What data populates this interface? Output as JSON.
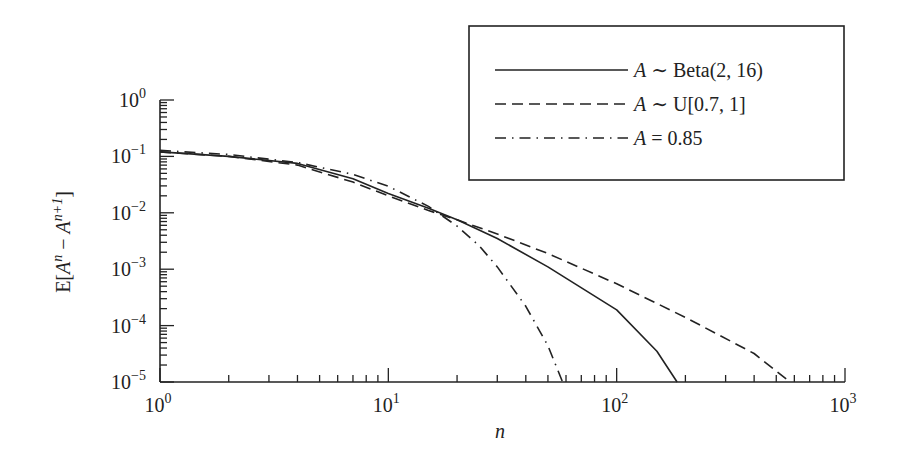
{
  "chart_data": {
    "type": "line",
    "title": "",
    "xlabel": "n",
    "ylabel": "E[A^n − A^(n+1)]",
    "xscale": "log",
    "yscale": "log",
    "xlim": [
      1,
      1000
    ],
    "ylim": [
      1e-05,
      1
    ],
    "grid": false,
    "legend_position": "upper right",
    "x_ticks": [
      {
        "value": 1,
        "base": "10",
        "exp": "0"
      },
      {
        "value": 10,
        "base": "10",
        "exp": "1"
      },
      {
        "value": 100,
        "base": "10",
        "exp": "2"
      },
      {
        "value": 1000,
        "base": "10",
        "exp": "3"
      }
    ],
    "y_ticks": [
      {
        "value": 1,
        "base": "10",
        "exp": "0"
      },
      {
        "value": 0.1,
        "base": "10",
        "exp": "−1"
      },
      {
        "value": 0.01,
        "base": "10",
        "exp": "−2"
      },
      {
        "value": 0.001,
        "base": "10",
        "exp": "−3"
      },
      {
        "value": 0.0001,
        "base": "10",
        "exp": "−4"
      },
      {
        "value": 1e-05,
        "base": "10",
        "exp": "−5"
      }
    ],
    "series": [
      {
        "name": "A ∼ Beta(2, 16)",
        "legend_prefix": "A",
        "legend_rest": " ∼ Beta(2, 16)",
        "style": "solid",
        "x": [
          1,
          2,
          4,
          7,
          10,
          15,
          20,
          30,
          50,
          100,
          150,
          184
        ],
        "values": [
          0.12,
          0.1,
          0.075,
          0.04,
          0.022,
          0.012,
          0.0075,
          0.0035,
          0.0011,
          0.00019,
          3.5e-05,
          1e-05
        ]
      },
      {
        "name": "A ∼ U[0.7, 1]",
        "legend_prefix": "A",
        "legend_rest": " ∼ U[0.7, 1]",
        "style": "dashed",
        "x": [
          1,
          2,
          4,
          7,
          10,
          15,
          20,
          30,
          50,
          100,
          200,
          400,
          575
        ],
        "values": [
          0.12,
          0.1,
          0.07,
          0.035,
          0.02,
          0.011,
          0.0075,
          0.0042,
          0.0019,
          0.00055,
          0.00014,
          3.2e-05,
          1e-05
        ]
      },
      {
        "name": "A = 0.85",
        "legend_prefix": "A",
        "legend_rest": " = 0.85",
        "style": "dashdot",
        "x": [
          1,
          2,
          4,
          7,
          10,
          15,
          20,
          25,
          30,
          40,
          50,
          58
        ],
        "values": [
          0.1275,
          0.108,
          0.078,
          0.048,
          0.0295,
          0.013,
          0.0058,
          0.0026,
          0.0011,
          0.00022,
          4.4e-05,
          1e-05
        ]
      }
    ]
  },
  "axes": {
    "x_label": "n",
    "y_label_prefix": "E[",
    "y_label_A1": "A",
    "y_label_exp1": "n",
    "y_label_mid": " − ",
    "y_label_A2": "A",
    "y_label_exp2": "n+1",
    "y_label_suffix": "]"
  }
}
